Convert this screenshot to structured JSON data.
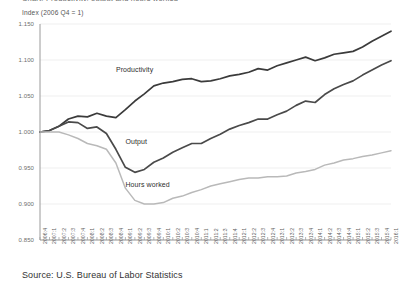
{
  "title_clipped": "Chart: Productivity, output and hours worked",
  "axis_note": "Index (2006 Q4 = 1)",
  "source": "Source: U.S. Bureau of Labor Statistics",
  "colors": {
    "productivity": "#3b3b3b",
    "output": "#4a4a4a",
    "hours": "#b9b9b9",
    "axis": "#9a9a9a",
    "grid": "#ebebeb",
    "text": "#5f5f5f"
  },
  "series_labels": {
    "productivity": "Productivity",
    "output": "Output",
    "hours": "Hours worked"
  },
  "chart_data": {
    "type": "line",
    "title": "Productivity, output and hours worked",
    "xlabel": "",
    "ylabel": "Index (2006 Q4 = 1)",
    "ylim": [
      0.85,
      1.15
    ],
    "yticks": [
      "0.850",
      "0.900",
      "0.950",
      "1.000",
      "1.050",
      "1.100",
      "1.150"
    ],
    "ytick_values": [
      0.85,
      0.9,
      0.95,
      1.0,
      1.05,
      1.1,
      1.15
    ],
    "grid": true,
    "legend": "inline-annotations",
    "x": [
      "2006:4",
      "2007:1",
      "2007:2",
      "2007:3",
      "2007:4",
      "2008:1",
      "2008:2",
      "2008:3",
      "2008:4",
      "2009:1",
      "2009:2",
      "2009:3",
      "2009:4",
      "2010:1",
      "2010:2",
      "2010:3",
      "2010:4",
      "2011:1",
      "2011:2",
      "2011:3",
      "2011:4",
      "2012:1",
      "2012:2",
      "2012:3",
      "2012:4",
      "2013:1",
      "2013:2",
      "2013:3",
      "2013:4",
      "2014:1",
      "2014:2",
      "2014:3",
      "2014:4",
      "2015:1",
      "2015:2",
      "2015:3",
      "2015:4",
      "2016:1"
    ],
    "series": [
      {
        "name": "Productivity",
        "color": "#3b3b3b",
        "values": [
          1.0,
          1.002,
          1.008,
          1.018,
          1.022,
          1.021,
          1.026,
          1.022,
          1.02,
          1.031,
          1.043,
          1.053,
          1.064,
          1.068,
          1.07,
          1.073,
          1.074,
          1.07,
          1.071,
          1.074,
          1.078,
          1.08,
          1.083,
          1.088,
          1.086,
          1.092,
          1.096,
          1.1,
          1.104,
          1.099,
          1.103,
          1.108,
          1.11,
          1.112,
          1.118,
          1.126,
          1.133,
          1.14
        ]
      },
      {
        "name": "Output",
        "color": "#4a4a4a",
        "values": [
          1.0,
          1.002,
          1.008,
          1.014,
          1.013,
          1.005,
          1.007,
          0.998,
          0.976,
          0.951,
          0.944,
          0.948,
          0.958,
          0.964,
          0.972,
          0.978,
          0.984,
          0.984,
          0.991,
          0.997,
          1.004,
          1.009,
          1.013,
          1.018,
          1.018,
          1.024,
          1.029,
          1.037,
          1.043,
          1.041,
          1.052,
          1.06,
          1.066,
          1.071,
          1.079,
          1.086,
          1.093,
          1.099
        ]
      },
      {
        "name": "Hours worked",
        "color": "#b9b9b9",
        "values": [
          1.0,
          1.0,
          1.0,
          0.996,
          0.991,
          0.984,
          0.981,
          0.976,
          0.957,
          0.922,
          0.905,
          0.9,
          0.9,
          0.902,
          0.908,
          0.911,
          0.916,
          0.92,
          0.925,
          0.928,
          0.931,
          0.934,
          0.936,
          0.936,
          0.938,
          0.938,
          0.939,
          0.943,
          0.945,
          0.948,
          0.954,
          0.957,
          0.961,
          0.963,
          0.966,
          0.968,
          0.971,
          0.974
        ]
      }
    ],
    "annotations": [
      {
        "text": "Productivity",
        "x": "2008:4",
        "y": 1.085
      },
      {
        "text": "Output",
        "x": "2009:1",
        "y": 0.985
      },
      {
        "text": "Hours worked",
        "x": "2009:1",
        "y": 0.925
      }
    ]
  }
}
